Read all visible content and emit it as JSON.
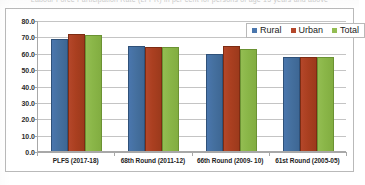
{
  "scan": {
    "clipped_title_text": "Labour Force Participation Rate (LFPR) in per cent for persons of age 15 years and above"
  },
  "legend": {
    "items": [
      {
        "label": "Rural",
        "color": "#4a76ad",
        "name": "rural"
      },
      {
        "label": "Urban",
        "color": "#b4472a",
        "name": "urban"
      },
      {
        "label": "Total",
        "color": "#93bd52",
        "name": "total"
      }
    ]
  },
  "chart_data": {
    "type": "bar",
    "title": "",
    "xlabel": "",
    "ylabel": "",
    "ylim": [
      0.0,
      80.0
    ],
    "ytick_step": 10.0,
    "ytick_labels": [
      "80.0",
      "70.0",
      "60.0",
      "50.0",
      "40.0",
      "30.0",
      "20.0",
      "10.0",
      "0.0"
    ],
    "ytick_values": [
      80.0,
      70.0,
      60.0,
      50.0,
      40.0,
      30.0,
      20.0,
      10.0,
      0.0
    ],
    "grid": true,
    "legend_position": "top-right",
    "categories": [
      "PLFS (2017-18)",
      "68th Round (2011-12)",
      "66th Round (2009- 10)",
      "61st Round (2005-05)"
    ],
    "series": [
      {
        "name": "Rural",
        "color": "#4a76ad",
        "values": [
          68.6,
          63.9,
          59.4,
          57.4
        ]
      },
      {
        "name": "Urban",
        "color": "#b4472a",
        "values": [
          71.5,
          63.7,
          63.9,
          57.6
        ]
      },
      {
        "name": "Total",
        "color": "#93bd52",
        "values": [
          70.8,
          63.8,
          62.1,
          57.5
        ]
      }
    ]
  }
}
